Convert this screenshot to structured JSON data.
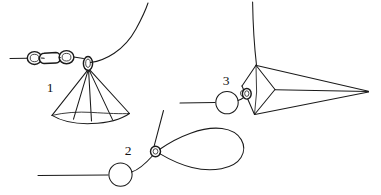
{
  "figure": {
    "background_color": "#ffffff",
    "stroke_color": "#1a1a1a",
    "width": 381,
    "height": 195,
    "labels": [
      {
        "id": "label-1",
        "text": "1",
        "x": 50,
        "y": 92
      },
      {
        "id": "label-2",
        "text": "2",
        "x": 128,
        "y": 155
      },
      {
        "id": "label-3",
        "text": "3",
        "x": 226,
        "y": 85
      }
    ],
    "structures": [
      {
        "id": "structure-1",
        "label": "1",
        "description": "Chain of four ring links on a horizontal filament terminating at a small crossing ring, from which a fan of lines forms a cone with a flattened base; a long curve sweeps up to the right.",
        "bead_count": 4,
        "fan_line_count": 5
      },
      {
        "id": "structure-2",
        "label": "2",
        "description": "Horizontal filament with a single large open circle, rising to a small crossing ring that opens into a broad teardrop loop to the right; a straight line runs up and to the right.",
        "bead_count": 1,
        "loop_shape": "teardrop"
      },
      {
        "id": "structure-3",
        "label": "3",
        "description": "Horizontal filament with a large open circle rising to a small double ring inside a kite-shaped outline; three long lines converge to a sharp point at the right edge; a near-vertical line rises from the top vertex.",
        "bead_count": 1,
        "loop_shape": "kite"
      }
    ]
  }
}
